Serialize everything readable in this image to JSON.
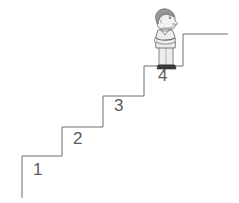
{
  "illustration": {
    "title": "Staircase with person standing on top step",
    "background_color": "#ffffff",
    "line_color": "#6e6e6e",
    "label_color": "#5a5a5a",
    "stroke_width": 1
  },
  "staircase": {
    "description": "Four-step staircase rising left to right with a landing at the top",
    "step_count": 4,
    "labels": [
      {
        "text": "1",
        "x": 33,
        "y": 168
      },
      {
        "text": "2",
        "x": 73,
        "y": 137
      },
      {
        "text": "3",
        "x": 114,
        "y": 103
      },
      {
        "text": "4",
        "x": 158,
        "y": 72
      }
    ],
    "outline_points": "22,198 22,156 62,156 62,127 103,127 103,96 144,96 144,66 183,66 183,34 228,34",
    "landing": {
      "from_x": 183,
      "to_x": 228,
      "y": 34
    }
  },
  "person": {
    "description": "Person in profile facing right, arms crossed, standing on the top step",
    "position": {
      "x": 148,
      "y": 8,
      "width": 36,
      "height": 62
    },
    "hair_color": "#9a9a9a",
    "skin_color": "#f2f0ee",
    "shirt_color": "#eceaea",
    "shoe_color": "#3a3a3a",
    "outline_color": "#6b6b6b",
    "facing": "right"
  }
}
